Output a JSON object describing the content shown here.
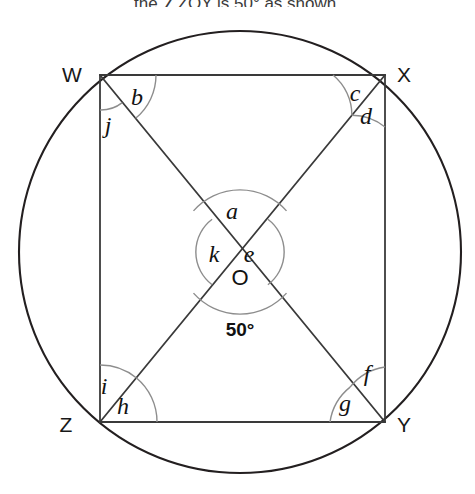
{
  "prompt": {
    "text": "the ∠ZOY is 50° as shown."
  },
  "figure": {
    "colors": {
      "stroke": "#231f20",
      "arc": "#8d8d8d",
      "text": "#111111"
    },
    "circle": {
      "centre_x": 240,
      "centre_y": 252,
      "radius": 221
    },
    "vertices": [
      {
        "id": "W",
        "label": "W",
        "x": 100,
        "y": 75,
        "label_x": 72,
        "label_y": 82
      },
      {
        "id": "X",
        "label": "X",
        "x": 385,
        "y": 75,
        "label_x": 404,
        "label_y": 82
      },
      {
        "id": "Y",
        "label": "Y",
        "x": 385,
        "y": 422,
        "label_x": 404,
        "label_y": 432
      },
      {
        "id": "Z",
        "label": "Z",
        "x": 100,
        "y": 422,
        "label_x": 66,
        "label_y": 432
      }
    ],
    "centre": {
      "label": "O",
      "x": 240,
      "y": 252,
      "label_x": 233,
      "label_y": 285
    },
    "measured_angle": {
      "label": "50°",
      "x": 240,
      "y": 336,
      "value": 50,
      "unit": "degrees",
      "at_vertex": "O",
      "description": "angle ZOY"
    },
    "angle_labels": [
      {
        "id": "b",
        "label": "b",
        "x": 137,
        "y": 105,
        "at_vertex": "W",
        "between": "WX and WY"
      },
      {
        "id": "j",
        "label": "j",
        "x": 108,
        "y": 133,
        "at_vertex": "W",
        "between": "WY and WZ"
      },
      {
        "id": "c",
        "label": "c",
        "x": 355,
        "y": 101,
        "at_vertex": "X",
        "between": "WX and XZ"
      },
      {
        "id": "d",
        "label": "d",
        "x": 366,
        "y": 124,
        "at_vertex": "X",
        "between": "XZ and XY"
      },
      {
        "id": "a",
        "label": "a",
        "x": 232,
        "y": 219,
        "at_vertex": "O",
        "between": "OW and OX"
      },
      {
        "id": "k",
        "label": "k",
        "x": 214,
        "y": 262,
        "at_vertex": "O",
        "between": "OW and OZ"
      },
      {
        "id": "e",
        "label": "e",
        "x": 249,
        "y": 262,
        "at_vertex": "O",
        "between": "OX and OY"
      },
      {
        "id": "i",
        "label": "i",
        "x": 104,
        "y": 394,
        "at_vertex": "Z",
        "between": "ZW and ZX"
      },
      {
        "id": "h",
        "label": "h",
        "x": 123,
        "y": 414,
        "at_vertex": "Z",
        "between": "ZX and ZY"
      },
      {
        "id": "f",
        "label": "f",
        "x": 367,
        "y": 381,
        "at_vertex": "Y",
        "between": "YX and YW"
      },
      {
        "id": "g",
        "label": "g",
        "x": 345,
        "y": 411,
        "at_vertex": "Y",
        "between": "YW and YZ"
      }
    ]
  }
}
